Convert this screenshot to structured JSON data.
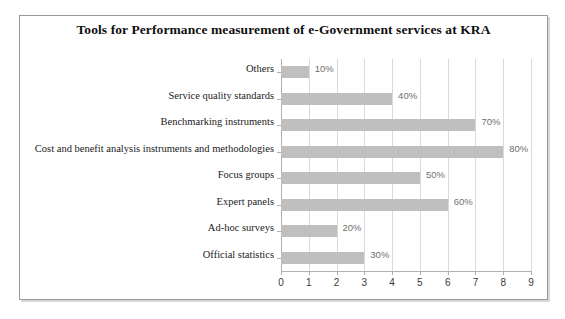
{
  "chart_data": {
    "type": "bar",
    "orientation": "horizontal",
    "title": "Tools for Performance measurement of e-Government services at KRA",
    "xlabel": "",
    "ylabel": "",
    "categories": [
      "Others",
      "Service quality standards",
      "Benchmarking instruments",
      "Cost and benefit analysis instruments and methodologies",
      "Focus groups",
      "Expert panels",
      "Ad-hoc surveys",
      "Official statistics"
    ],
    "values": [
      1,
      4,
      7,
      8,
      5,
      6,
      2,
      3
    ],
    "data_labels": [
      "10%",
      "40%",
      "70%",
      "80%",
      "50%",
      "60%",
      "20%",
      "30%"
    ],
    "xlim": [
      0,
      9
    ],
    "xticks": [
      "0",
      "1",
      "2",
      "3",
      "4",
      "5",
      "6",
      "7",
      "8",
      "9"
    ],
    "grid": true,
    "legend": false,
    "bar_color": "#bfbfbf",
    "gridline_color": "#d9d9d9",
    "axis_color": "#b0b0b0"
  }
}
